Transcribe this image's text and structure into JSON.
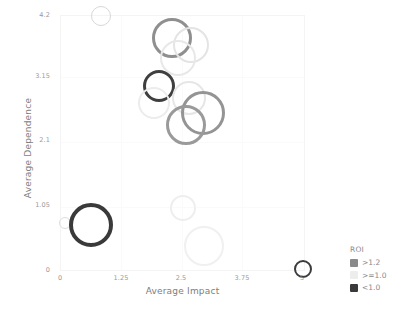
{
  "chart_data": {
    "type": "scatter",
    "title": "",
    "xlabel": "Average Impact",
    "ylabel": "Average Dependence",
    "xlim": [
      0,
      5
    ],
    "ylim": [
      0,
      4.2
    ],
    "xticks": [
      "0",
      "1.25",
      "2.5",
      "3.75",
      "5"
    ],
    "yticks": [
      "0",
      "1.05",
      "2.1",
      "3.15",
      "4.2"
    ],
    "grid": false,
    "legend": {
      "title": "ROI",
      "position": "right",
      "entries": [
        {
          "label": ">1.2",
          "color": "#8a8a8a"
        },
        {
          "label": ">=1.0",
          "color": "#ededed"
        },
        {
          "label": "<1.0",
          "color": "#3a3a3a"
        }
      ]
    },
    "size_encoding": "bubble size / ring thickness",
    "points": [
      {
        "x": 0.82,
        "y": 4.2,
        "size": 10,
        "ring": 1.6,
        "roi": ">=1.0",
        "color": "#d8d8d8"
      },
      {
        "x": 2.28,
        "y": 3.83,
        "size": 20,
        "ring": 3.2,
        "roi": ">1.2",
        "color": "#8f8f8f"
      },
      {
        "x": 2.67,
        "y": 3.72,
        "size": 18,
        "ring": 2.6,
        "roi": ">=1.0",
        "color": "#e4e4e4"
      },
      {
        "x": 2.4,
        "y": 3.5,
        "size": 18,
        "ring": 2.6,
        "roi": ">=1.0",
        "color": "#e8e8e8"
      },
      {
        "x": 2.02,
        "y": 3.05,
        "size": 16,
        "ring": 3.0,
        "roi": "<1.0",
        "color": "#3f3f3f"
      },
      {
        "x": 2.64,
        "y": 2.84,
        "size": 17,
        "ring": 2.4,
        "roi": ">=1.0",
        "color": "#e6e6e6"
      },
      {
        "x": 1.92,
        "y": 2.76,
        "size": 16,
        "ring": 2.4,
        "roi": ">=1.0",
        "color": "#ececec"
      },
      {
        "x": 2.92,
        "y": 2.6,
        "size": 22,
        "ring": 3.4,
        "roi": ">1.2",
        "color": "#949494"
      },
      {
        "x": 2.58,
        "y": 2.4,
        "size": 20,
        "ring": 3.4,
        "roi": ">1.2",
        "color": "#9a9a9a"
      },
      {
        "x": 2.52,
        "y": 1.03,
        "size": 13,
        "ring": 2.0,
        "roi": ">=1.0",
        "color": "#eeeeee"
      },
      {
        "x": 0.08,
        "y": 0.78,
        "size": 6,
        "ring": 1.2,
        "roi": ">=1.0",
        "color": "#dddddd"
      },
      {
        "x": 0.62,
        "y": 0.75,
        "size": 22,
        "ring": 4.6,
        "roi": "<1.0",
        "color": "#3a3a3a"
      },
      {
        "x": 2.95,
        "y": 0.4,
        "size": 20,
        "ring": 2.6,
        "roi": ">=1.0",
        "color": "#f0f0f0"
      },
      {
        "x": 4.98,
        "y": 0.02,
        "size": 9,
        "ring": 2.2,
        "roi": "<1.0",
        "color": "#3c3c3c"
      }
    ]
  },
  "axes": {
    "x_title": "Average Impact",
    "y_title": "Average Dependence",
    "x_tick_labels": [
      "0",
      "1.25",
      "2.5",
      "3.75",
      "5"
    ],
    "y_tick_labels": [
      "0",
      "1.05",
      "2.1",
      "3.15",
      "4.2"
    ]
  },
  "legend": {
    "title": "ROI",
    "items": [
      {
        "label": ">1.2"
      },
      {
        "label": ">=1.0"
      },
      {
        "label": "<1.0"
      }
    ]
  }
}
